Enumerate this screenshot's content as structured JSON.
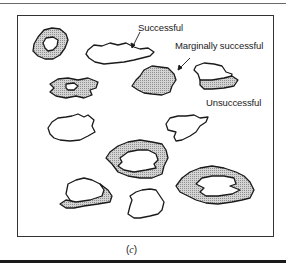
{
  "figure": {
    "caption_open": "(",
    "caption_letter": "c",
    "caption_close": ")",
    "labels": {
      "successful": "Successful",
      "marginal": "Marginally successful",
      "unsuccessful": "Unsuccessful"
    },
    "fill_color": "#bdbdbd",
    "stroke_color": "#1a1a1a"
  }
}
